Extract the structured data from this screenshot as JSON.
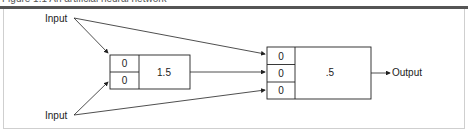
{
  "caption": "Figure 1.1  An artificial neural network",
  "inputs": [
    "Input",
    "Input"
  ],
  "output": "Output",
  "node1": {
    "weights": [
      "0",
      "0"
    ],
    "threshold": "1.5"
  },
  "node2": {
    "weights": [
      "0",
      "0",
      "0"
    ],
    "threshold": ".5"
  }
}
